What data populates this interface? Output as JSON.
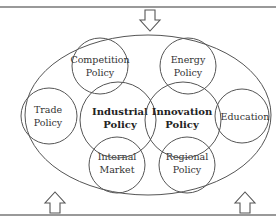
{
  "colors": {
    "stroke": "#555555",
    "frame": "#777777",
    "text": "#333333",
    "background": "#ffffff"
  },
  "frame": {
    "top_line_y": 7,
    "bottom_line_y": 215
  },
  "arrows": [
    {
      "id": "top",
      "direction": "down",
      "x": 150
    },
    {
      "id": "bottom-left",
      "direction": "up",
      "x": 55
    },
    {
      "id": "bottom-right",
      "direction": "up",
      "x": 245
    }
  ],
  "outer_ellipse": {
    "cx": 148,
    "cy": 115,
    "rx": 123,
    "ry": 80
  },
  "circles": {
    "competition": {
      "lines": [
        "Competition",
        "Policy"
      ],
      "cx": 100,
      "cy": 66,
      "r": 28,
      "bold": false
    },
    "energy": {
      "lines": [
        "Energy",
        "Policy"
      ],
      "cx": 188,
      "cy": 66,
      "r": 28,
      "bold": false
    },
    "trade": {
      "lines": [
        "Trade",
        "Policy"
      ],
      "cx": 49,
      "cy": 116,
      "r": 28,
      "bold": false
    },
    "education": {
      "lines": [
        "Education"
      ],
      "cx": 242,
      "cy": 116,
      "r": 27,
      "bold": false
    },
    "internal_market": {
      "lines": [
        "Internal",
        "Market"
      ],
      "cx": 117,
      "cy": 165,
      "r": 28,
      "bold": false
    },
    "regional": {
      "lines": [
        "Regional",
        "Policy"
      ],
      "cx": 187,
      "cy": 165,
      "r": 28,
      "bold": false
    },
    "industrial": {
      "lines": [
        "Industrial",
        "Policy"
      ],
      "cx": 118,
      "cy": 120,
      "r": 38,
      "bold": true
    },
    "innovation": {
      "lines": [
        "Innovation",
        "Policy"
      ],
      "cx": 183,
      "cy": 120,
      "r": 38,
      "bold": true
    }
  }
}
